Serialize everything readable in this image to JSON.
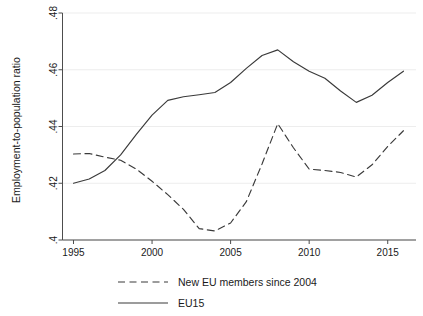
{
  "chart_data": {
    "type": "line",
    "title": "",
    "xlabel": "",
    "ylabel": "Employment-to-population ratio",
    "xlim": [
      1994.3,
      2016.8
    ],
    "ylim": [
      0.4,
      0.48
    ],
    "xticks": [
      1995,
      2000,
      2005,
      2010,
      2015
    ],
    "xtick_labels": [
      "1995",
      "2000",
      "2005",
      "2010",
      "2015"
    ],
    "yticks": [
      0.4,
      0.42,
      0.44,
      0.46,
      0.48
    ],
    "ytick_labels": [
      ".4",
      ".42",
      ".44",
      ".46",
      ".48"
    ],
    "grid": "horizontal-light",
    "legend_position": "below-center",
    "x": [
      1995,
      1996,
      1997,
      1998,
      1999,
      2000,
      2001,
      2002,
      2003,
      2004,
      2005,
      2006,
      2007,
      2008,
      2009,
      2010,
      2011,
      2012,
      2013,
      2014,
      2015,
      2016
    ],
    "series": [
      {
        "name": "New EU members since 2004",
        "style": "dashed",
        "color": "#3a3a3a",
        "values": [
          0.4303,
          0.4305,
          0.4292,
          0.4281,
          0.425,
          0.4207,
          0.416,
          0.4108,
          0.404,
          0.4032,
          0.406,
          0.4135,
          0.4268,
          0.441,
          0.4325,
          0.425,
          0.4245,
          0.4238,
          0.4222,
          0.4265,
          0.433,
          0.4385
        ]
      },
      {
        "name": "EU15",
        "style": "solid",
        "color": "#3a3a3a",
        "values": [
          0.42,
          0.4215,
          0.4245,
          0.43,
          0.4372,
          0.444,
          0.4492,
          0.4505,
          0.4512,
          0.452,
          0.4555,
          0.4605,
          0.465,
          0.467,
          0.4628,
          0.4595,
          0.457,
          0.4525,
          0.4485,
          0.451,
          0.4555,
          0.4595
        ]
      }
    ],
    "legend": [
      {
        "label": "New EU members since 2004",
        "style": "dashed"
      },
      {
        "label": "EU15",
        "style": "solid"
      }
    ]
  }
}
